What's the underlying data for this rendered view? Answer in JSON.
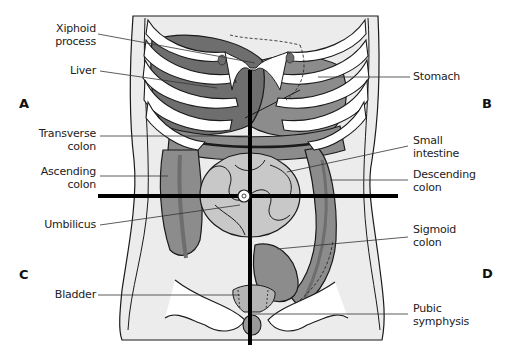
{
  "figure": {
    "quadrants": [
      {
        "id": "A",
        "label": "A"
      },
      {
        "id": "B",
        "label": "B"
      },
      {
        "id": "C",
        "label": "C"
      },
      {
        "id": "D",
        "label": "D"
      }
    ],
    "labels_left": [
      {
        "text_line1": "Xiphoid",
        "text_line2": "process"
      },
      {
        "text_line1": "Liver",
        "text_line2": ""
      },
      {
        "text_line1": "Transverse",
        "text_line2": "colon"
      },
      {
        "text_line1": "Ascending",
        "text_line2": "colon"
      },
      {
        "text_line1": "Umbilicus",
        "text_line2": ""
      },
      {
        "text_line1": "Bladder",
        "text_line2": ""
      }
    ],
    "labels_right": [
      {
        "text_line1": "Stomach",
        "text_line2": ""
      },
      {
        "text_line1": "Small",
        "text_line2": "intestine"
      },
      {
        "text_line1": "Descending",
        "text_line2": "colon"
      },
      {
        "text_line1": "Sigmoid",
        "text_line2": "colon"
      },
      {
        "text_line1": "Pubic",
        "text_line2": "symphysis"
      }
    ],
    "colors": {
      "skin": "#ececec",
      "bone": "#ffffff",
      "organ_dark": "#6e6e6e",
      "organ_mid": "#8c8c8c",
      "organ_light": "#b4b4b4",
      "intestine": "#c8c8c8",
      "outline": "#1a1a1a",
      "crosshair": "#000000"
    }
  }
}
